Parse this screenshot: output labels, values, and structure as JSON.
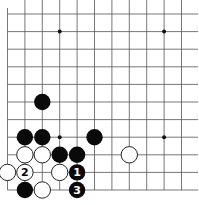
{
  "board": {
    "title": "Go board diagram (lower-left corner)",
    "columns": 12,
    "rows": 11,
    "edges": [
      "left",
      "bottom"
    ],
    "star_points": [
      [
        3,
        1
      ],
      [
        9,
        1
      ],
      [
        3,
        7
      ],
      [
        9,
        7
      ]
    ],
    "stones": [
      {
        "color": "black",
        "col": 2,
        "row": 5,
        "label": ""
      },
      {
        "color": "black",
        "col": 1,
        "row": 7,
        "label": ""
      },
      {
        "color": "black",
        "col": 2,
        "row": 7,
        "label": ""
      },
      {
        "color": "black",
        "col": 5,
        "row": 7,
        "label": ""
      },
      {
        "color": "white",
        "col": 1,
        "row": 8,
        "label": ""
      },
      {
        "color": "white",
        "col": 2,
        "row": 8,
        "label": ""
      },
      {
        "color": "black",
        "col": 3,
        "row": 8,
        "label": ""
      },
      {
        "color": "black",
        "col": 4,
        "row": 8,
        "label": ""
      },
      {
        "color": "white",
        "col": 7,
        "row": 8,
        "label": ""
      },
      {
        "color": "white",
        "col": 0,
        "row": 9,
        "label": ""
      },
      {
        "color": "white",
        "col": 1,
        "row": 9,
        "label": "2"
      },
      {
        "color": "white",
        "col": 3,
        "row": 9,
        "label": ""
      },
      {
        "color": "black",
        "col": 4,
        "row": 9,
        "label": "1"
      },
      {
        "color": "black",
        "col": 1,
        "row": 10,
        "label": ""
      },
      {
        "color": "white",
        "col": 2,
        "row": 10,
        "label": ""
      },
      {
        "color": "black",
        "col": 4,
        "row": 10,
        "label": "3"
      }
    ]
  },
  "colors": {
    "black": "#0a0a0a",
    "white": "#ffffff",
    "line": "#555555"
  }
}
